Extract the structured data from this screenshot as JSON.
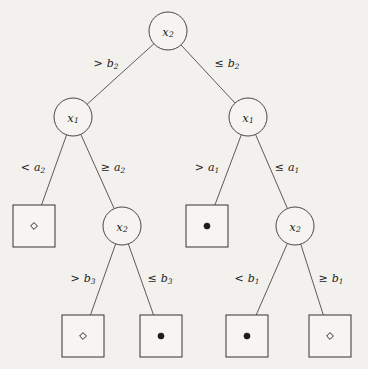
{
  "figure": {
    "name": "decision-tree-diagram",
    "background_color": "#f3f1ed",
    "stroke_color": "#3d3d3d",
    "width": 368,
    "height": 369
  },
  "chart_data": {
    "type": "diagram",
    "title": "",
    "diagram_kind": "binary-decision-tree",
    "nodes": [
      {
        "id": "n0",
        "kind": "decision",
        "label": "x",
        "subscript": "2",
        "x": 168,
        "y": 31,
        "r": 19,
        "depth": 0
      },
      {
        "id": "n1",
        "kind": "decision",
        "label": "x",
        "subscript": "1",
        "x": 73,
        "y": 117,
        "r": 19,
        "depth": 1
      },
      {
        "id": "n2",
        "kind": "decision",
        "label": "x",
        "subscript": "1",
        "x": 248,
        "y": 117,
        "r": 19,
        "depth": 1
      },
      {
        "id": "n3",
        "kind": "leaf",
        "marker": "hollow-diamond",
        "x": 34,
        "y": 226,
        "w": 42,
        "h": 42,
        "depth": 2
      },
      {
        "id": "n4",
        "kind": "decision",
        "label": "x",
        "subscript": "2",
        "x": 122,
        "y": 226,
        "r": 19,
        "depth": 2
      },
      {
        "id": "n5",
        "kind": "leaf",
        "marker": "filled-dot",
        "x": 207,
        "y": 226,
        "w": 42,
        "h": 42,
        "depth": 2
      },
      {
        "id": "n6",
        "kind": "decision",
        "label": "x",
        "subscript": "2",
        "x": 295,
        "y": 226,
        "r": 19,
        "depth": 2
      },
      {
        "id": "n7",
        "kind": "leaf",
        "marker": "hollow-diamond",
        "x": 83,
        "y": 336,
        "w": 42,
        "h": 42,
        "depth": 3
      },
      {
        "id": "n8",
        "kind": "leaf",
        "marker": "filled-dot",
        "x": 161,
        "y": 336,
        "w": 42,
        "h": 42,
        "depth": 3
      },
      {
        "id": "n9",
        "kind": "leaf",
        "marker": "filled-dot",
        "x": 247,
        "y": 336,
        "w": 42,
        "h": 42,
        "depth": 3
      },
      {
        "id": "n10",
        "kind": "leaf",
        "marker": "hollow-diamond",
        "x": 330,
        "y": 336,
        "w": 42,
        "h": 42,
        "depth": 3
      }
    ],
    "edges": [
      {
        "id": "e0",
        "from": "n0",
        "to": "n1",
        "operator": ">",
        "variable": "b",
        "subscript": "2",
        "label": "> b2",
        "label_x": 106,
        "label_y": 64
      },
      {
        "id": "e1",
        "from": "n0",
        "to": "n2",
        "operator": "≤",
        "variable": "b",
        "subscript": "2",
        "label": "≤ b2",
        "label_x": 227,
        "label_y": 64
      },
      {
        "id": "e2",
        "from": "n1",
        "to": "n3",
        "operator": "<",
        "variable": "a",
        "subscript": "2",
        "label": "< a2",
        "label_x": 33,
        "label_y": 168
      },
      {
        "id": "e3",
        "from": "n1",
        "to": "n4",
        "operator": "≥",
        "variable": "a",
        "subscript": "2",
        "label": "≥ a2",
        "label_x": 113,
        "label_y": 168
      },
      {
        "id": "e4",
        "from": "n2",
        "to": "n5",
        "operator": ">",
        "variable": "a",
        "subscript": "1",
        "label": "> a1",
        "label_x": 207,
        "label_y": 168
      },
      {
        "id": "e5",
        "from": "n2",
        "to": "n6",
        "operator": "≤",
        "variable": "a",
        "subscript": "1",
        "label": "≤ a1",
        "label_x": 287,
        "label_y": 168
      },
      {
        "id": "e6",
        "from": "n4",
        "to": "n7",
        "operator": ">",
        "variable": "b",
        "subscript": "3",
        "label": "> b3",
        "label_x": 83,
        "label_y": 279
      },
      {
        "id": "e7",
        "from": "n4",
        "to": "n8",
        "operator": "≤",
        "variable": "b",
        "subscript": "3",
        "label": "≤ b3",
        "label_x": 160,
        "label_y": 279
      },
      {
        "id": "e8",
        "from": "n6",
        "to": "n9",
        "operator": "<",
        "variable": "b",
        "subscript": "1",
        "label": "< b1",
        "label_x": 247,
        "label_y": 279
      },
      {
        "id": "e9",
        "from": "n6",
        "to": "n10",
        "operator": "≥",
        "variable": "b",
        "subscript": "1",
        "label": "≥ b1",
        "label_x": 331,
        "label_y": 279
      }
    ],
    "legend": [],
    "markers": {
      "hollow-diamond": "open diamond class marker",
      "filled-dot": "filled circle class marker"
    }
  }
}
